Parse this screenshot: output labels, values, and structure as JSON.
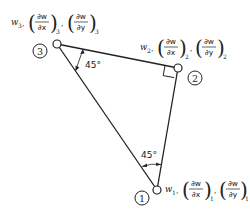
{
  "diagram": {
    "type": "triangular-element",
    "nodes": [
      {
        "id": "1",
        "label": "1",
        "var": "w",
        "sub": "1",
        "dx_num": "∂w",
        "dx_den": "∂x",
        "dy_num": "∂w",
        "dy_den": "∂y"
      },
      {
        "id": "2",
        "label": "2",
        "var": "w",
        "sub": "2",
        "dx_num": "∂w",
        "dx_den": "∂x",
        "dy_num": "∂w",
        "dy_den": "∂y"
      },
      {
        "id": "3",
        "label": "3",
        "var": "w",
        "sub": "3",
        "dx_num": "∂w",
        "dx_den": "∂x",
        "dy_num": "∂w",
        "dy_den": "∂y"
      }
    ],
    "angles": {
      "at_node_3": "45°",
      "at_node_1": "45°",
      "at_node_2": "right-angle"
    },
    "separator": ","
  }
}
